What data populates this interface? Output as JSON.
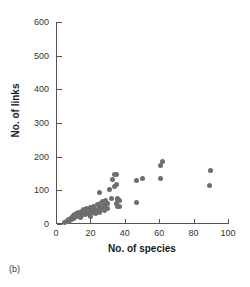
{
  "figure": {
    "panel_label": "(b)"
  },
  "chart_data": {
    "type": "scatter",
    "title": "",
    "xlabel": "No. of species",
    "ylabel": "No. of links",
    "xlim": [
      0,
      100
    ],
    "ylim": [
      0,
      600
    ],
    "xticks": [
      0,
      20,
      40,
      60,
      80,
      100
    ],
    "yticks": [
      0,
      100,
      200,
      300,
      400,
      500,
      600
    ],
    "xtick_labels": [
      "0",
      "20",
      "40",
      "60",
      "80",
      "100"
    ],
    "ytick_labels": [
      "0",
      "100",
      "200",
      "300",
      "400",
      "500",
      "600"
    ],
    "grid": false,
    "legend": null,
    "marker": {
      "shape": "circle",
      "color": "#6e6e6e",
      "size_px": 5
    },
    "series": [
      {
        "name": "food webs",
        "points": [
          [
            5,
            4
          ],
          [
            6,
            6
          ],
          [
            7,
            8
          ],
          [
            7,
            14
          ],
          [
            8,
            10
          ],
          [
            9,
            12
          ],
          [
            9,
            20
          ],
          [
            10,
            15
          ],
          [
            10,
            24
          ],
          [
            11,
            18
          ],
          [
            11,
            28
          ],
          [
            12,
            22
          ],
          [
            12,
            31
          ],
          [
            13,
            26
          ],
          [
            13,
            34
          ],
          [
            14,
            20
          ],
          [
            14,
            30
          ],
          [
            15,
            25
          ],
          [
            15,
            38
          ],
          [
            16,
            33
          ],
          [
            16,
            44
          ],
          [
            17,
            29
          ],
          [
            17,
            40
          ],
          [
            18,
            36
          ],
          [
            18,
            47
          ],
          [
            19,
            31
          ],
          [
            19,
            43
          ],
          [
            20,
            22
          ],
          [
            20,
            38
          ],
          [
            20,
            50
          ],
          [
            21,
            35
          ],
          [
            21,
            46
          ],
          [
            22,
            41
          ],
          [
            22,
            52
          ],
          [
            23,
            30
          ],
          [
            23,
            44
          ],
          [
            24,
            38
          ],
          [
            24,
            57
          ],
          [
            25,
            34
          ],
          [
            25,
            49
          ],
          [
            25,
            93
          ],
          [
            26,
            42
          ],
          [
            26,
            60
          ],
          [
            27,
            46
          ],
          [
            27,
            66
          ],
          [
            28,
            39
          ],
          [
            28,
            55
          ],
          [
            29,
            50
          ],
          [
            29,
            70
          ],
          [
            30,
            45
          ],
          [
            30,
            62
          ],
          [
            31,
            103
          ],
          [
            32,
            75
          ],
          [
            33,
            131
          ],
          [
            34,
            112
          ],
          [
            34,
            146
          ],
          [
            35,
            60
          ],
          [
            35,
            118
          ],
          [
            35,
            148
          ],
          [
            36,
            52
          ],
          [
            36,
            72
          ],
          [
            36,
            77
          ],
          [
            37,
            52
          ],
          [
            37,
            71
          ],
          [
            47,
            64
          ],
          [
            47,
            130
          ],
          [
            50,
            135
          ],
          [
            61,
            136
          ],
          [
            61,
            175
          ],
          [
            62,
            186
          ],
          [
            89,
            115
          ],
          [
            90,
            159
          ]
        ]
      }
    ]
  }
}
